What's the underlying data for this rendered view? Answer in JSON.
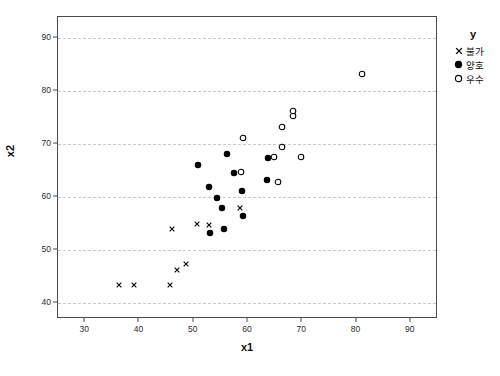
{
  "chart_data": {
    "type": "scatter",
    "title": "",
    "xlabel": "x1",
    "ylabel": "x2",
    "xlim": [
      25,
      95
    ],
    "ylim": [
      37,
      94
    ],
    "xticks": [
      30,
      40,
      50,
      60,
      70,
      80,
      90
    ],
    "yticks": [
      40,
      50,
      60,
      70,
      80,
      90
    ],
    "grid": "horizontal-dashed",
    "legend": {
      "title": "y",
      "position": "right-top",
      "entries": [
        {
          "label": "불가",
          "marker": "x",
          "marker_name": "x-marker"
        },
        {
          "label": "양호",
          "marker": "filled-circle",
          "marker_name": "filled-circle-marker"
        },
        {
          "label": "우수",
          "marker": "open-circle",
          "marker_name": "open-circle-marker"
        }
      ]
    },
    "series": [
      {
        "name": "불가",
        "marker": "x",
        "points": [
          [
            36.2,
            43.5
          ],
          [
            39.0,
            43.5
          ],
          [
            45.6,
            43.5
          ],
          [
            47.0,
            46.2
          ],
          [
            48.5,
            47.3
          ],
          [
            46.0,
            54.0
          ],
          [
            50.6,
            55.0
          ],
          [
            52.8,
            54.8
          ],
          [
            58.6,
            57.9
          ]
        ]
      },
      {
        "name": "양호",
        "marker": "filled-circle",
        "points": [
          [
            53.0,
            53.3
          ],
          [
            55.6,
            54.0
          ],
          [
            50.8,
            66.0
          ],
          [
            52.8,
            62.0
          ],
          [
            54.2,
            59.8
          ],
          [
            55.2,
            58.0
          ],
          [
            56.2,
            68.1
          ],
          [
            57.4,
            64.6
          ],
          [
            58.9,
            61.2
          ],
          [
            59.0,
            56.4
          ],
          [
            63.7,
            67.3
          ],
          [
            63.5,
            63.2
          ]
        ]
      },
      {
        "name": "우수",
        "marker": "open-circle",
        "points": [
          [
            59.1,
            71.2
          ],
          [
            58.8,
            64.8
          ],
          [
            64.8,
            67.6
          ],
          [
            65.6,
            62.8
          ],
          [
            66.2,
            73.2
          ],
          [
            66.2,
            69.5
          ],
          [
            68.2,
            75.3
          ],
          [
            68.2,
            76.2
          ],
          [
            69.8,
            67.6
          ],
          [
            81.0,
            83.2
          ]
        ]
      }
    ]
  }
}
